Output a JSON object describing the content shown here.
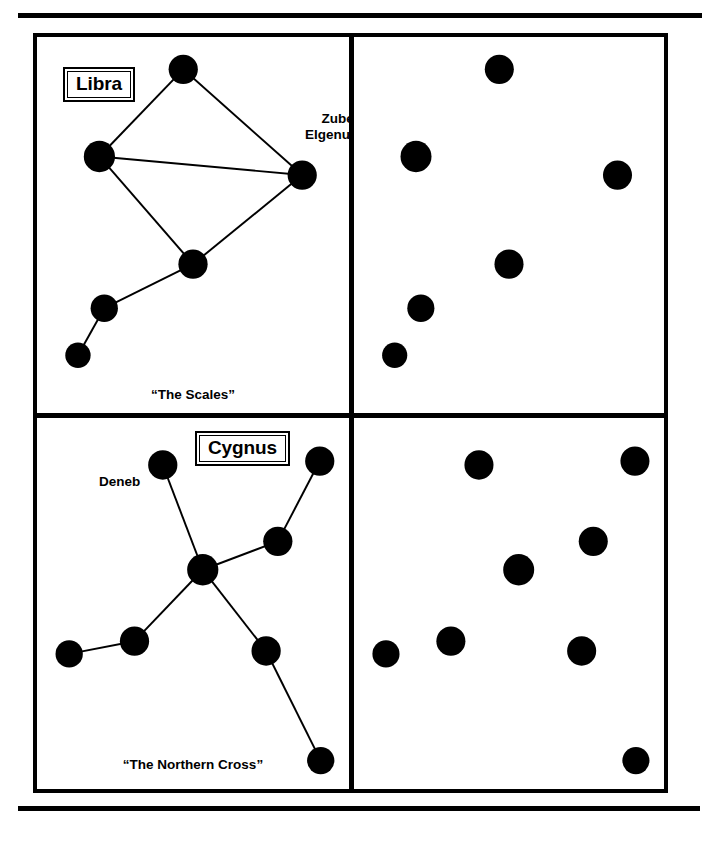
{
  "figure": {
    "title_rule_top": "horizontal-rule",
    "title_rule_bottom": "horizontal-rule"
  },
  "panels": {
    "top_left": {
      "name": "Libra",
      "caption": "“The Scales”",
      "star_label": "Zuben\nElgenubi"
    },
    "top_right": {
      "name": "",
      "caption": ""
    },
    "bottom_left": {
      "name": "Cygnus",
      "caption": "“The Northern Cross”",
      "star_label": "Deneb"
    },
    "bottom_right": {
      "name": "",
      "caption": ""
    }
  },
  "colors": {
    "star": "#000000",
    "line": "#000000",
    "border": "#000000",
    "background": "#ffffff"
  },
  "chart_data": {
    "type": "scatter",
    "panel_coordinate_space": {
      "width": 320,
      "height": 384,
      "units": "px"
    },
    "charts": [
      {
        "id": "libra-connected",
        "panel": "top_left",
        "constellation": "Libra",
        "caption": "“The Scales”",
        "lines_drawn": true,
        "stars": [
          {
            "id": "s1",
            "x": 150,
            "y": 33,
            "r": 15,
            "label": ""
          },
          {
            "id": "s2",
            "x": 64,
            "y": 122,
            "r": 16,
            "label": ""
          },
          {
            "id": "s3",
            "x": 272,
            "y": 141,
            "r": 15,
            "label": "Zuben Elgenubi"
          },
          {
            "id": "s4",
            "x": 160,
            "y": 232,
            "r": 15,
            "label": ""
          },
          {
            "id": "s5",
            "x": 69,
            "y": 277,
            "r": 14,
            "label": ""
          },
          {
            "id": "s6",
            "x": 42,
            "y": 325,
            "r": 13,
            "label": ""
          }
        ],
        "edges": [
          [
            "s1",
            "s2"
          ],
          [
            "s1",
            "s3"
          ],
          [
            "s2",
            "s3"
          ],
          [
            "s2",
            "s4"
          ],
          [
            "s3",
            "s4"
          ],
          [
            "s4",
            "s5"
          ],
          [
            "s5",
            "s6"
          ]
        ]
      },
      {
        "id": "libra-plain",
        "panel": "top_right",
        "constellation": "Libra",
        "caption": "",
        "lines_drawn": false,
        "stars": [
          {
            "id": "s1",
            "x": 150,
            "y": 33,
            "r": 15,
            "label": ""
          },
          {
            "id": "s2",
            "x": 64,
            "y": 122,
            "r": 16,
            "label": ""
          },
          {
            "id": "s3",
            "x": 272,
            "y": 141,
            "r": 15,
            "label": ""
          },
          {
            "id": "s4",
            "x": 160,
            "y": 232,
            "r": 15,
            "label": ""
          },
          {
            "id": "s5",
            "x": 69,
            "y": 277,
            "r": 14,
            "label": ""
          },
          {
            "id": "s6",
            "x": 42,
            "y": 325,
            "r": 13,
            "label": ""
          }
        ],
        "edges": []
      },
      {
        "id": "cygnus-connected",
        "panel": "bottom_left",
        "constellation": "Cygnus",
        "caption": "“The Northern Cross”",
        "lines_drawn": true,
        "stars": [
          {
            "id": "c1",
            "x": 129,
            "y": 48,
            "r": 15,
            "label": "Deneb"
          },
          {
            "id": "c2",
            "x": 290,
            "y": 44,
            "r": 15,
            "label": ""
          },
          {
            "id": "c3",
            "x": 247,
            "y": 126,
            "r": 15,
            "label": ""
          },
          {
            "id": "c4",
            "x": 170,
            "y": 155,
            "r": 16,
            "label": ""
          },
          {
            "id": "c5",
            "x": 100,
            "y": 228,
            "r": 15,
            "label": ""
          },
          {
            "id": "c6",
            "x": 33,
            "y": 241,
            "r": 14,
            "label": ""
          },
          {
            "id": "c7",
            "x": 235,
            "y": 238,
            "r": 15,
            "label": ""
          },
          {
            "id": "c8",
            "x": 291,
            "y": 350,
            "r": 14,
            "label": ""
          }
        ],
        "edges": [
          [
            "c1",
            "c4"
          ],
          [
            "c4",
            "c3"
          ],
          [
            "c3",
            "c2"
          ],
          [
            "c4",
            "c5"
          ],
          [
            "c5",
            "c6"
          ],
          [
            "c4",
            "c7"
          ],
          [
            "c7",
            "c8"
          ]
        ]
      },
      {
        "id": "cygnus-plain",
        "panel": "bottom_right",
        "constellation": "Cygnus",
        "caption": "",
        "lines_drawn": false,
        "stars": [
          {
            "id": "c1",
            "x": 129,
            "y": 48,
            "r": 15,
            "label": ""
          },
          {
            "id": "c2",
            "x": 290,
            "y": 44,
            "r": 15,
            "label": ""
          },
          {
            "id": "c3",
            "x": 247,
            "y": 126,
            "r": 15,
            "label": ""
          },
          {
            "id": "c4",
            "x": 170,
            "y": 155,
            "r": 16,
            "label": ""
          },
          {
            "id": "c5",
            "x": 100,
            "y": 228,
            "r": 15,
            "label": ""
          },
          {
            "id": "c6",
            "x": 33,
            "y": 241,
            "r": 14,
            "label": ""
          },
          {
            "id": "c7",
            "x": 235,
            "y": 238,
            "r": 15,
            "label": ""
          },
          {
            "id": "c8",
            "x": 291,
            "y": 350,
            "r": 14,
            "label": ""
          }
        ],
        "edges": []
      }
    ]
  }
}
